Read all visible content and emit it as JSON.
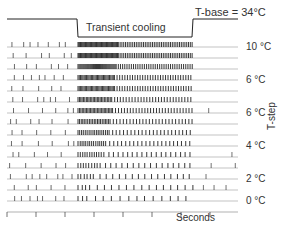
{
  "figure": {
    "tbase_label": "T-base =  34°C",
    "cooling_label": "Transient cooling",
    "y_axis_label": "T-step",
    "x_axis_label": "Seconds",
    "step_labels": [
      {
        "text": "10 °C",
        "row": 0
      },
      {
        "text": "6 °C",
        "row": 3
      },
      {
        "text": "6 °C",
        "row": 6
      },
      {
        "text": "4 °C",
        "row": 9
      },
      {
        "text": "2 °C",
        "row": 12
      },
      {
        "text": "0 °C",
        "row": 14
      }
    ]
  },
  "chart_data": {
    "type": "raster",
    "title": "Transient cooling",
    "annotation": "T-base = 34°C",
    "xlabel": "Seconds",
    "ylabel": "T-step",
    "stimulus_trace": {
      "baseline_level": "T-base 34°C",
      "cool_start_x_px": 77,
      "cool_end_x_px": 193
    },
    "rows": 15,
    "row_labels": [
      "10 °C",
      "",
      "",
      "6 °C",
      "",
      "",
      "6 °C",
      "",
      "",
      "4 °C",
      "",
      "",
      "2 °C",
      "",
      "0 °C"
    ],
    "burst_density_by_row": [
      1.0,
      1.0,
      0.95,
      0.9,
      0.9,
      0.85,
      0.85,
      0.8,
      0.75,
      0.7,
      0.6,
      0.5,
      0.4,
      0.25,
      0.15
    ],
    "legend": [],
    "grid": false
  },
  "colors": {
    "ink": "#222222",
    "bg": "#ffffff"
  }
}
